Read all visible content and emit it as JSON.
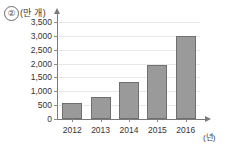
{
  "figure": {
    "item_number": "②",
    "y_axis_unit": "(만 개)",
    "x_axis_unit": "(년)"
  },
  "chart_data": {
    "type": "bar",
    "title": "",
    "xlabel": "(년)",
    "ylabel": "(만 개)",
    "categories": [
      "2012",
      "2013",
      "2014",
      "2015",
      "2016"
    ],
    "values": [
      560,
      780,
      1330,
      1950,
      3000
    ],
    "ylim": [
      0,
      3500
    ],
    "ytick_values": [
      0,
      500,
      1000,
      1500,
      2000,
      2500,
      3000,
      3500
    ],
    "ytick_labels": [
      "0",
      "500",
      "1,000",
      "1,500",
      "2,000",
      "2,500",
      "3,000",
      "3,500"
    ],
    "grid": true,
    "legend": null,
    "bar_color": "#9a9a9a",
    "bar_border_color": "#6f6f6f",
    "gridline_color": "#e8e8e8",
    "axis_color": "#7a7a7a"
  }
}
